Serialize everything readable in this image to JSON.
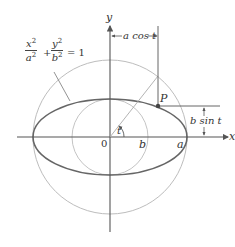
{
  "diagram": {
    "equation": {
      "x_term_num": "x",
      "x_term_den": "a",
      "y_term_num": "y",
      "y_term_den": "b",
      "exp": "2",
      "plus": "+",
      "equals": "= 1"
    },
    "axis_labels": {
      "x": "x",
      "y": "y",
      "origin": "0"
    },
    "point_labels": {
      "P": "P",
      "a": "a",
      "b": "b",
      "angle": "t"
    },
    "dimension_labels": {
      "horizontal": "a cos t",
      "vertical": "b sin t"
    },
    "colors": {
      "axes": "#555555",
      "circles": "#b8b8b8",
      "ellipse": "#666666",
      "point": "#444444"
    }
  }
}
